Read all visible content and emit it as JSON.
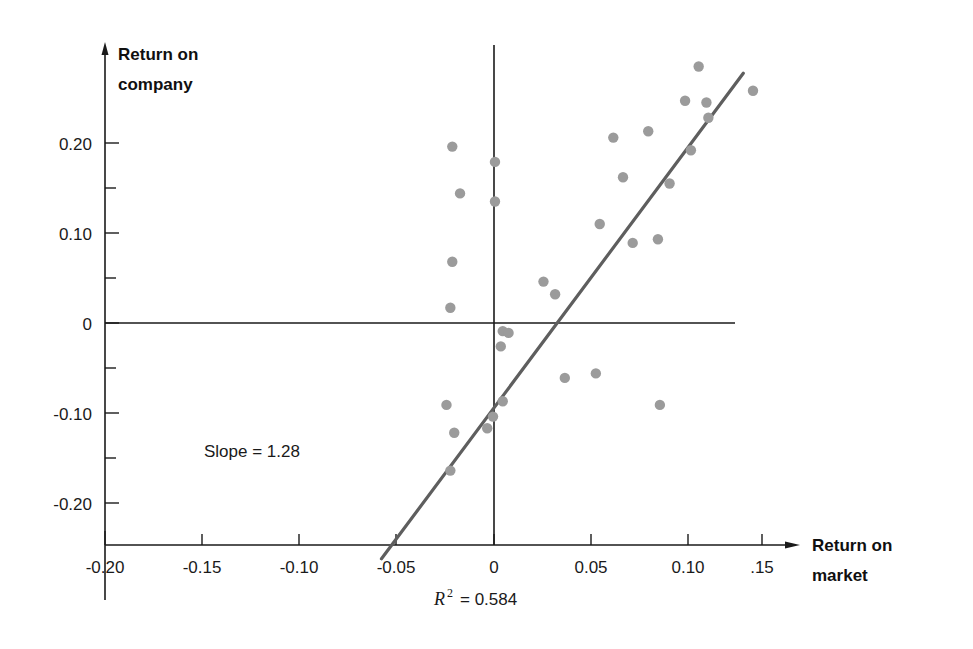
{
  "chart_data": {
    "type": "scatter",
    "title": "",
    "xlabel": "Return on market",
    "ylabel": "Return on company",
    "xlim": [
      -0.21,
      0.165
    ],
    "ylim": [
      -0.265,
      0.3
    ],
    "grid": false,
    "legend": null,
    "xticks": [
      -0.2,
      -0.15,
      -0.1,
      -0.05,
      0,
      0.05,
      0.1,
      0.15
    ],
    "xticklabels": [
      "-0.20",
      "-0.15",
      "-0.10",
      "-0.05",
      "0",
      "0.05",
      "0.10",
      ".15"
    ],
    "yticks": [
      0.2,
      0.1,
      0,
      -0.1,
      -0.2
    ],
    "yticklabels": [
      "0.20",
      "0.10",
      "0",
      "-0.10",
      "-0.20"
    ],
    "minor_yticks": [
      0.15,
      0.05,
      -0.05,
      -0.15
    ],
    "point_color": "#9b9b9b",
    "line_color": "#5e5e5e",
    "axis_color": "#1a1a1a",
    "points": [
      {
        "x": -0.0215,
        "y": 0.196
      },
      {
        "x": -0.0175,
        "y": 0.144
      },
      {
        "x": -0.0215,
        "y": 0.068
      },
      {
        "x": -0.0225,
        "y": 0.017
      },
      {
        "x": -0.0245,
        "y": -0.091
      },
      {
        "x": -0.0205,
        "y": -0.122
      },
      {
        "x": -0.0225,
        "y": -0.164
      },
      {
        "x": 0.0005,
        "y": 0.179
      },
      {
        "x": 0.0005,
        "y": 0.135
      },
      {
        "x": 0.0045,
        "y": -0.009
      },
      {
        "x": 0.0075,
        "y": -0.011
      },
      {
        "x": 0.0035,
        "y": -0.026
      },
      {
        "x": 0.0045,
        "y": -0.087
      },
      {
        "x": -0.0005,
        "y": -0.104
      },
      {
        "x": -0.0035,
        "y": -0.117
      },
      {
        "x": 0.0255,
        "y": 0.046
      },
      {
        "x": 0.0315,
        "y": 0.032
      },
      {
        "x": 0.0365,
        "y": -0.061
      },
      {
        "x": 0.0545,
        "y": 0.11
      },
      {
        "x": 0.0615,
        "y": 0.206
      },
      {
        "x": 0.0525,
        "y": -0.056
      },
      {
        "x": 0.0665,
        "y": 0.162
      },
      {
        "x": 0.0715,
        "y": 0.089
      },
      {
        "x": 0.0845,
        "y": 0.093
      },
      {
        "x": 0.0855,
        "y": -0.091
      },
      {
        "x": 0.0795,
        "y": 0.213
      },
      {
        "x": 0.0905,
        "y": 0.155
      },
      {
        "x": 0.0985,
        "y": 0.247
      },
      {
        "x": 0.1015,
        "y": 0.192
      },
      {
        "x": 0.1055,
        "y": 0.285
      },
      {
        "x": 0.1095,
        "y": 0.245
      },
      {
        "x": 0.1105,
        "y": 0.228
      },
      {
        "x": 0.1335,
        "y": 0.258
      }
    ],
    "fit_line": {
      "slope": 1.28,
      "label": "Slope  =  1.28",
      "x_start": -0.058,
      "y_start": -0.262,
      "x_end": 0.1285,
      "y_end": 0.2775
    },
    "annotations": {
      "slope_text": "Slope  =  1.28",
      "r_squared_symbol": "R",
      "r_squared_exponent": "2",
      "r_squared_value": "=  0.584",
      "r_squared_full": "R2 = 0.584"
    }
  }
}
